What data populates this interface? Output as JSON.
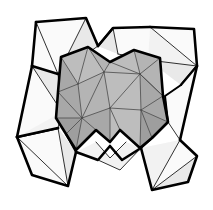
{
  "figure": {
    "title": "Star-shaped polyhedral wireframe diagram",
    "canvas": {
      "width": 213,
      "height": 210,
      "background": "#ffffff"
    },
    "palette": {
      "background": "#ffffff",
      "outer_face_light": "#fafafa",
      "outer_face": "#f2f2f2",
      "outer_face_shade": "#e9e9e9",
      "inner_face_light": "#bdbdbd",
      "inner_face": "#b4b4b4",
      "inner_face_shade": "#a8a8a8",
      "inner_face_dark": "#9e9e9e",
      "edge_bold": "#000000",
      "edge_thin": "#1a1a1a",
      "edge_soft": "#4a4a4a"
    },
    "parts": [
      {
        "name": "arm-top-left",
        "shade": "outer_face",
        "label": "upper-left arm"
      },
      {
        "name": "arm-top-right",
        "shade": "outer_face_light",
        "label": "upper-right arm"
      },
      {
        "name": "arm-bottom-left",
        "shade": "outer_face",
        "label": "lower-left arm"
      },
      {
        "name": "arm-bottom-right",
        "shade": "outer_face_light",
        "label": "lower-right arm"
      },
      {
        "name": "inner-body",
        "shade": "inner_face",
        "label": "central cube body"
      }
    ]
  }
}
